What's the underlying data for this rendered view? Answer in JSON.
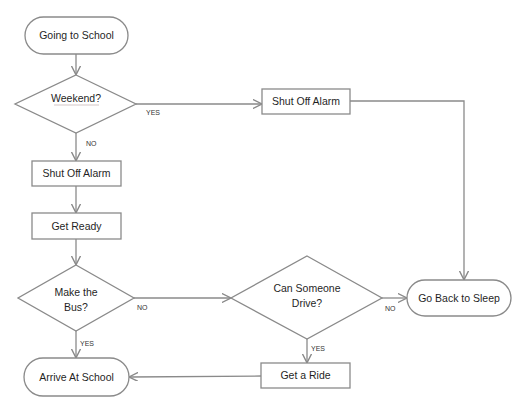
{
  "diagram": {
    "colors": {
      "stroke": "#8a8a8a",
      "fill": "#ffffff",
      "text": "#1f1f1f"
    },
    "nodes": {
      "start": {
        "type": "terminal",
        "label": "Going to School"
      },
      "weekend": {
        "type": "decision",
        "label": "Weekend?"
      },
      "shut_off_alarm_weekend": {
        "type": "process",
        "label": "Shut Off Alarm"
      },
      "shut_off_alarm_weekday": {
        "type": "process",
        "label": "Shut Off Alarm"
      },
      "get_ready": {
        "type": "process",
        "label": "Get Ready"
      },
      "make_bus": {
        "type": "decision",
        "label_line1": "Make the",
        "label_line2": "Bus?"
      },
      "can_drive": {
        "type": "decision",
        "label_line1": "Can Someone",
        "label_line2": "Drive?"
      },
      "go_back_to_sleep": {
        "type": "terminal",
        "label": "Go Back to Sleep"
      },
      "get_a_ride": {
        "type": "process",
        "label": "Get a Ride"
      },
      "arrive": {
        "type": "terminal",
        "label": "Arrive At School"
      }
    },
    "edges": {
      "weekend_yes": {
        "from": "weekend",
        "to": "shut_off_alarm_weekend",
        "label": "YES"
      },
      "weekend_no": {
        "from": "weekend",
        "to": "shut_off_alarm_weekday",
        "label": "NO"
      },
      "make_bus_no": {
        "from": "make_bus",
        "to": "can_drive",
        "label": "NO"
      },
      "make_bus_yes": {
        "from": "make_bus",
        "to": "arrive",
        "label": "YES"
      },
      "can_drive_no": {
        "from": "can_drive",
        "to": "go_back_to_sleep",
        "label": "NO"
      },
      "can_drive_yes": {
        "from": "can_drive",
        "to": "get_a_ride",
        "label": "YES"
      }
    }
  }
}
